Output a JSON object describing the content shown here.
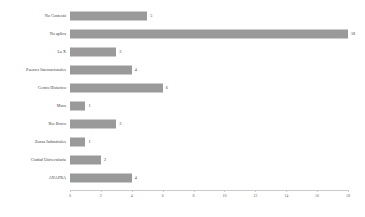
{
  "chart_data": {
    "type": "bar",
    "orientation": "horizontal",
    "title": "",
    "subtitle": "",
    "xlabel": "",
    "ylabel": "",
    "categories": [
      "No Contestó",
      "No aplica",
      "La X",
      "Puentes Internacionales",
      "Centro Historico",
      "Muro",
      "Rio Bravo",
      "Zonas Industriales",
      "Ciudad Universitaria",
      "ANAPRA"
    ],
    "values": [
      5,
      18,
      3,
      4,
      6,
      1,
      3,
      1,
      2,
      4
    ],
    "data_labels": [
      "5",
      "18",
      "3",
      "4",
      "6",
      "1",
      "3",
      "1",
      "2",
      "4"
    ],
    "xlim": [
      0,
      18
    ],
    "xticks": [
      0,
      2,
      4,
      6,
      8,
      10,
      12,
      14,
      16,
      18
    ],
    "xtick_labels": [
      "0",
      "2",
      "4",
      "6",
      "8",
      "10",
      "12",
      "14",
      "16",
      "18"
    ],
    "grid": false,
    "legend": false,
    "legend_position": "none",
    "bar_color": "#9a9a9a",
    "axis_color": "#c9c9c9",
    "text_color": "#3a3a3a",
    "tick_label_color": "#6e6e6e",
    "background_color": "#ffffff"
  }
}
